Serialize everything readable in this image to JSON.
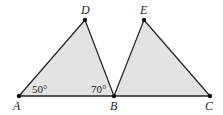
{
  "diagram": {
    "colors": {
      "fill": "#e3e3e3",
      "stroke": "#222222",
      "text": "#222222"
    },
    "points": {
      "A": {
        "x": 19,
        "y": 96,
        "label": "A"
      },
      "B": {
        "x": 114,
        "y": 96,
        "label": "B"
      },
      "C": {
        "x": 210,
        "y": 96,
        "label": "C"
      },
      "D": {
        "x": 85,
        "y": 20,
        "label": "D"
      },
      "E": {
        "x": 144,
        "y": 20,
        "label": "E"
      }
    },
    "triangles": [
      {
        "name": "ABD",
        "vertices": [
          "A",
          "B",
          "D"
        ]
      },
      {
        "name": "BCE",
        "vertices": [
          "B",
          "C",
          "E"
        ]
      }
    ],
    "segments": [
      "AC"
    ],
    "angles": [
      {
        "vertex": "A",
        "label": "50°"
      },
      {
        "vertex": "B",
        "label": "70°"
      }
    ]
  }
}
